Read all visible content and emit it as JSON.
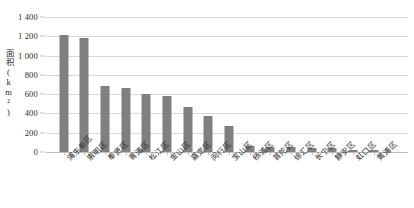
{
  "chart_data": {
    "type": "bar",
    "title": "",
    "xlabel": "",
    "ylabel": "面积(km²)",
    "ylim": [
      0,
      1400
    ],
    "yticks": [
      "0",
      "200",
      "400",
      "600",
      "800",
      "1 000",
      "1 200",
      "1 400"
    ],
    "ytick_values": [
      0,
      200,
      400,
      600,
      800,
      1000,
      1200,
      1400
    ],
    "grid": true,
    "legend": "none",
    "bar_color": "#808080",
    "gridline_color": "#d9d9d9",
    "categories": [
      "浦东新区",
      "崇明区",
      "奉贤区",
      "青浦区",
      "松江区",
      "金山区",
      "嘉定区",
      "闵行区",
      "宝山区",
      "杨浦区",
      "普陀区",
      "徐汇区",
      "长宁区",
      "静安区",
      "虹口区",
      "黄浦区"
    ],
    "values": [
      1210,
      1185,
      687,
      668,
      605,
      586,
      464,
      372,
      271,
      61,
      55,
      55,
      38,
      37,
      24,
      20
    ]
  }
}
